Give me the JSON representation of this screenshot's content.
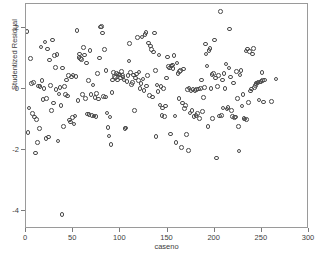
{
  "chart_data": {
    "type": "scatter",
    "title": "",
    "xlabel": "caseno",
    "ylabel": "Studentized Residual",
    "xlim": [
      0,
      300
    ],
    "ylim": [
      -4.6,
      2.8
    ],
    "xticks": [
      0,
      50,
      100,
      150,
      200,
      250,
      300
    ],
    "xticklabels": [
      "0",
      "50",
      "100",
      "150",
      "200",
      "250",
      "300"
    ],
    "yticks": [
      2,
      0,
      -2,
      -4
    ],
    "yticklabels": [
      "2",
      "0",
      "-2",
      "-4"
    ],
    "grid": false,
    "legend": null,
    "marker": {
      "shape": "open-circle",
      "edge_color": "#4a4a4a",
      "fill_color": "none",
      "size_px": 4.6
    },
    "series": [
      {
        "name": "Studentized Residual",
        "points": [
          [
            1,
            1.9
          ],
          [
            2,
            -1.42
          ],
          [
            3,
            -0.62
          ],
          [
            5,
            1.0
          ],
          [
            6,
            0.18
          ],
          [
            7,
            -0.8
          ],
          [
            8,
            0.22
          ],
          [
            9,
            -0.92
          ],
          [
            10,
            -2.1
          ],
          [
            11,
            -1.0
          ],
          [
            12,
            -1.75
          ],
          [
            13,
            0.1
          ],
          [
            14,
            -1.3
          ],
          [
            15,
            0.08
          ],
          [
            16,
            1.38
          ],
          [
            17,
            0.28
          ],
          [
            18,
            -0.34
          ],
          [
            19,
            0.02
          ],
          [
            20,
            1.55
          ],
          [
            21,
            -1.62
          ],
          [
            22,
            -0.3
          ],
          [
            23,
            1.32
          ],
          [
            24,
            -1.58
          ],
          [
            25,
            0.96
          ],
          [
            26,
            0.12
          ],
          [
            27,
            -0.7
          ],
          [
            28,
            1.62
          ],
          [
            29,
            -0.46
          ],
          [
            30,
            1.1
          ],
          [
            31,
            0.72
          ],
          [
            32,
            -0.02
          ],
          [
            33,
            1.14
          ],
          [
            34,
            -1.7
          ],
          [
            35,
            -0.16
          ],
          [
            36,
            0.06
          ],
          [
            37,
            -0.54
          ],
          [
            38,
            -4.12
          ],
          [
            39,
            0.7
          ],
          [
            40,
            -1.22
          ],
          [
            41,
            0.08
          ],
          [
            42,
            -0.18
          ],
          [
            43,
            0.3
          ],
          [
            44,
            -0.22
          ],
          [
            45,
            0.44
          ],
          [
            46,
            -1.02
          ],
          [
            47,
            -1.08
          ],
          [
            48,
            0.4
          ],
          [
            49,
            -0.94
          ],
          [
            50,
            0.46
          ],
          [
            51,
            -1.14
          ],
          [
            52,
            -0.88
          ],
          [
            53,
            0.42
          ],
          [
            54,
            1.92
          ],
          [
            55,
            -0.38
          ],
          [
            56,
            1.04
          ],
          [
            57,
            1.16
          ],
          [
            58,
            1.0
          ],
          [
            59,
            0.98
          ],
          [
            60,
            -0.18
          ],
          [
            61,
            1.36
          ],
          [
            62,
            1.12
          ],
          [
            63,
            -0.3
          ],
          [
            64,
            0.86
          ],
          [
            65,
            -0.82
          ],
          [
            66,
            0.28
          ],
          [
            67,
            -0.84
          ],
          [
            68,
            1.28
          ],
          [
            69,
            -0.18
          ],
          [
            70,
            -0.86
          ],
          [
            71,
            0.14
          ],
          [
            72,
            -0.88
          ],
          [
            73,
            -0.28
          ],
          [
            74,
            -0.9
          ],
          [
            75,
            -0.14
          ],
          [
            76,
            0.52
          ],
          [
            77,
            -0.32
          ],
          [
            78,
            1.02
          ],
          [
            79,
            2.04
          ],
          [
            80,
            2.06
          ],
          [
            81,
            1.84
          ],
          [
            82,
            -0.24
          ],
          [
            83,
            1.3
          ],
          [
            84,
            -0.26
          ],
          [
            85,
            0.62
          ],
          [
            86,
            -0.78
          ],
          [
            87,
            -1.26
          ],
          [
            88,
            -1.54
          ],
          [
            89,
            -0.92
          ],
          [
            90,
            -1.82
          ],
          [
            91,
            -0.12
          ],
          [
            92,
            0.3
          ],
          [
            93,
            0.54
          ],
          [
            94,
            0.42
          ],
          [
            95,
            0.38
          ],
          [
            96,
            0.52
          ],
          [
            97,
            0.3
          ],
          [
            98,
            0.5
          ],
          [
            99,
            0.46
          ],
          [
            100,
            0.36
          ],
          [
            101,
            0.58
          ],
          [
            102,
            0.44
          ],
          [
            103,
            0.4
          ],
          [
            104,
            0.3
          ],
          [
            105,
            -1.3
          ],
          [
            106,
            -1.28
          ],
          [
            107,
            0.26
          ],
          [
            108,
            0.44
          ],
          [
            109,
            0.92
          ],
          [
            110,
            1.5
          ],
          [
            111,
            0.54
          ],
          [
            112,
            0.16
          ],
          [
            113,
            0.22
          ],
          [
            114,
            0.46
          ],
          [
            115,
            -0.7
          ],
          [
            116,
            0.36
          ],
          [
            117,
            0.5
          ],
          [
            118,
            1.7
          ],
          [
            119,
            0.28
          ],
          [
            120,
            0.56
          ],
          [
            121,
            0.02
          ],
          [
            122,
            0.18
          ],
          [
            123,
            1.72
          ],
          [
            124,
            0.34
          ],
          [
            125,
            -0.04
          ],
          [
            126,
            1.8
          ],
          [
            127,
            1.86
          ],
          [
            128,
            0.1
          ],
          [
            129,
            0.44
          ],
          [
            130,
            1.52
          ],
          [
            131,
            -0.2
          ],
          [
            132,
            1.42
          ],
          [
            133,
            1.3
          ],
          [
            134,
            -0.26
          ],
          [
            135,
            1.22
          ],
          [
            136,
            1.84
          ],
          [
            137,
            0.62
          ],
          [
            138,
            -1.56
          ],
          [
            139,
            0.14
          ],
          [
            140,
            -0.08
          ],
          [
            141,
            1.12
          ],
          [
            142,
            -0.52
          ],
          [
            143,
            0.08
          ],
          [
            144,
            -0.86
          ],
          [
            145,
            -0.62
          ],
          [
            146,
            0.02
          ],
          [
            147,
            -0.9
          ],
          [
            148,
            -0.56
          ],
          [
            149,
            0.36
          ],
          [
            150,
            1.06
          ],
          [
            151,
            0.74
          ],
          [
            152,
            0.7
          ],
          [
            153,
            -1.48
          ],
          [
            154,
            0.76
          ],
          [
            155,
            0.8
          ],
          [
            156,
            0.68
          ],
          [
            157,
            1.1
          ],
          [
            158,
            -0.88
          ],
          [
            159,
            -1.76
          ],
          [
            160,
            0.86
          ],
          [
            161,
            0.52
          ],
          [
            162,
            -0.3
          ],
          [
            163,
            0.58
          ],
          [
            164,
            0.62
          ],
          [
            165,
            -1.92
          ],
          [
            166,
            -0.46
          ],
          [
            167,
            0.66
          ],
          [
            168,
            -0.64
          ],
          [
            169,
            -0.54
          ],
          [
            170,
            -1.5
          ],
          [
            171,
            -0.02
          ],
          [
            172,
            -2.02
          ],
          [
            173,
            0.04
          ],
          [
            174,
            -0.78
          ],
          [
            175,
            -0.06
          ],
          [
            176,
            -0.7
          ],
          [
            177,
            -0.02
          ],
          [
            178,
            -0.9
          ],
          [
            179,
            -0.04
          ],
          [
            180,
            -0.86
          ],
          [
            181,
            -0.02
          ],
          [
            182,
            -0.8
          ],
          [
            183,
            0.0
          ],
          [
            184,
            -0.96
          ],
          [
            185,
            0.02
          ],
          [
            186,
            0.3
          ],
          [
            187,
            -0.74
          ],
          [
            188,
            -0.28
          ],
          [
            189,
            0.06
          ],
          [
            190,
            1.48
          ],
          [
            191,
            1.16
          ],
          [
            192,
            0.76
          ],
          [
            193,
            -1.22
          ],
          [
            194,
            1.28
          ],
          [
            195,
            1.34
          ],
          [
            196,
            0.02
          ],
          [
            197,
            0.48
          ],
          [
            198,
            -0.96
          ],
          [
            199,
            0.52
          ],
          [
            200,
            1.62
          ],
          [
            201,
            0.36
          ],
          [
            202,
            -2.26
          ],
          [
            203,
            0.08
          ],
          [
            204,
            0.44
          ],
          [
            205,
            -0.88
          ],
          [
            206,
            2.55
          ],
          [
            207,
            -0.86
          ],
          [
            208,
            0.3
          ],
          [
            209,
            -0.62
          ],
          [
            210,
            0.52
          ],
          [
            211,
            0.02
          ],
          [
            212,
            0.82
          ],
          [
            213,
            -0.66
          ],
          [
            214,
            -0.6
          ],
          [
            215,
            0.7
          ],
          [
            216,
            1.98
          ],
          [
            217,
            0.4
          ],
          [
            218,
            -0.7
          ],
          [
            219,
            -0.9
          ],
          [
            220,
            0.2
          ],
          [
            221,
            -0.94
          ],
          [
            222,
            -0.92
          ],
          [
            223,
            0.58
          ],
          [
            224,
            -0.3
          ],
          [
            225,
            -1.22
          ],
          [
            226,
            -2.04
          ],
          [
            227,
            0.46
          ],
          [
            228,
            0.62
          ],
          [
            229,
            -0.56
          ],
          [
            230,
            -0.18
          ],
          [
            231,
            -0.96
          ],
          [
            232,
            -0.98
          ],
          [
            233,
            1.26
          ],
          [
            234,
            -1.0
          ],
          [
            235,
            1.32
          ],
          [
            236,
            -0.44
          ],
          [
            237,
            1.24
          ],
          [
            238,
            -0.06
          ],
          [
            239,
            0.0
          ],
          [
            240,
            1.16
          ],
          [
            241,
            1.34
          ],
          [
            242,
            0.06
          ],
          [
            243,
            0.12
          ],
          [
            244,
            0.18
          ],
          [
            245,
            0.2
          ],
          [
            246,
            0.22
          ],
          [
            247,
            -0.36
          ],
          [
            248,
            0.24
          ],
          [
            249,
            0.26
          ],
          [
            250,
            0.54
          ],
          [
            251,
            0.28
          ],
          [
            252,
            -0.42
          ],
          [
            253,
            0.3
          ],
          [
            260,
            -0.4
          ],
          [
            265,
            0.34
          ]
        ]
      }
    ]
  }
}
